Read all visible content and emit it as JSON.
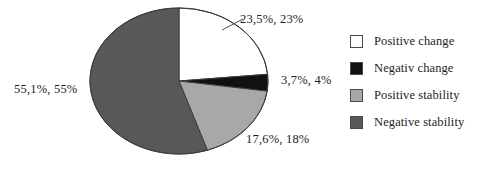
{
  "chart_data": {
    "type": "pie",
    "title": "",
    "labels": [
      "Positive change",
      "Negativ change",
      "Positive stability",
      "Negative stability"
    ],
    "values": [
      23.5,
      3.7,
      17.6,
      55.1
    ],
    "rounded_values": [
      23,
      4,
      18,
      55
    ],
    "value_labels": [
      "23,5%, 23%",
      "3,7%, 4%",
      "17,6%, 18%",
      "55,1%, 55%"
    ],
    "colors": [
      "#ffffff",
      "#111111",
      "#a8a8a8",
      "#585858"
    ],
    "start_angle_deg": 0,
    "direction": "clockwise",
    "legend_position": "right",
    "grid": false
  },
  "legend": {
    "items": [
      {
        "label": "Positive change",
        "color": "#ffffff"
      },
      {
        "label": "Negativ change",
        "color": "#111111"
      },
      {
        "label": "Positive stability",
        "color": "#a8a8a8"
      },
      {
        "label": "Negative stability",
        "color": "#585858"
      }
    ]
  },
  "callouts": {
    "positive_change": "23,5%, 23%",
    "negativ_change": "3,7%, 4%",
    "positive_stability": "17,6%, 18%",
    "negative_stability": "55,1%, 55%"
  }
}
